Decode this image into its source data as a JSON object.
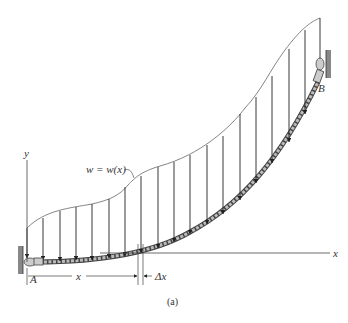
{
  "figure": {
    "caption": "(a)",
    "labels": {
      "load_function": "w = w(x)",
      "point_a": "A",
      "point_b": "B",
      "x_axis": "x",
      "y_axis": "y",
      "dimension_x": "x",
      "dimension_dx": "Δx"
    },
    "colors": {
      "line": "#333333",
      "cable_fill": "#9a9a9a",
      "wall": "#777777"
    },
    "load_arrow_count": 19
  }
}
